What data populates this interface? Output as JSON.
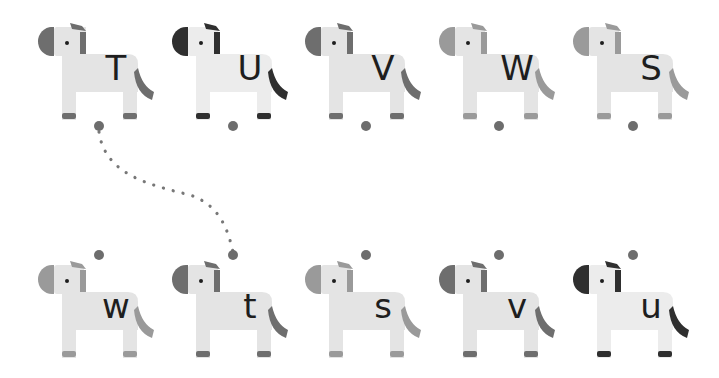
{
  "game": {
    "type": "letter-matching",
    "top_row": [
      {
        "letter": "T",
        "shade": "mid"
      },
      {
        "letter": "U",
        "shade": "dark"
      },
      {
        "letter": "V",
        "shade": "mid"
      },
      {
        "letter": "W",
        "shade": "light"
      },
      {
        "letter": "S",
        "shade": "light"
      }
    ],
    "bottom_row": [
      {
        "letter": "w",
        "shade": "light"
      },
      {
        "letter": "t",
        "shade": "mid"
      },
      {
        "letter": "s",
        "shade": "light"
      },
      {
        "letter": "v",
        "shade": "mid"
      },
      {
        "letter": "u",
        "shade": "dark"
      }
    ],
    "connections": [
      {
        "from": "T",
        "to": "t"
      }
    ]
  },
  "colors": {
    "body": "#e4e4e4",
    "body_dark_variant": "#ececec",
    "mid_accent": "#6e6e6e",
    "dark_accent": "#2f2f2f",
    "light_accent": "#9a9a9a",
    "dot": "#6d6d6d",
    "letter": "#1e1e1e",
    "background": "#ffffff"
  }
}
